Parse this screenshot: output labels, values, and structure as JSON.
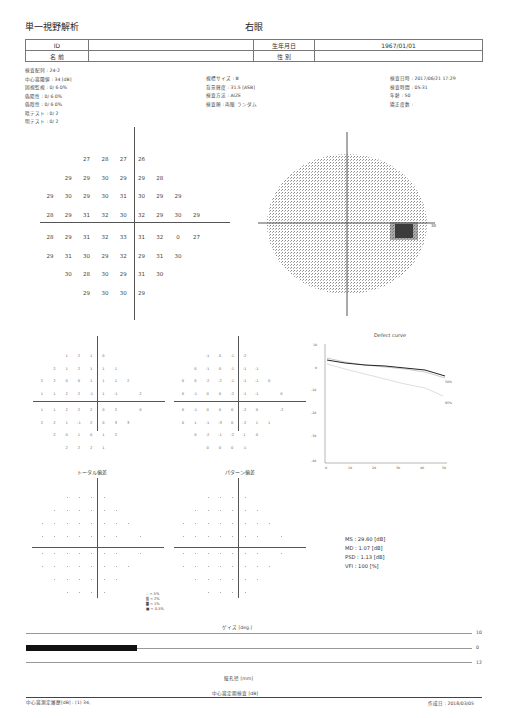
{
  "header": {
    "report_title": "単一視野解析",
    "eye": "右眼",
    "id_label": "ID",
    "id_value": "",
    "name_label": "名 前",
    "name_value": "",
    "dob_label": "生年月日",
    "dob_value": "1967/01/01",
    "sex_label": "性 別",
    "sex_value": ""
  },
  "info_left": [
    "検査配列 : 24-2",
    "中心窩閾値 : 34 [dB]",
    "固視監視 : 0/ 6  0%",
    "偽陽性 : 0/ 6  0%",
    "偽陰性 : 0/ 6  0%",
    "暗テスト : 0/ 2",
    "明テスト : 0/ 2"
  ],
  "info_mid": [
    "視標サイズ : Ⅲ",
    "背景輝度 : 31.5 [ASB]",
    "検査方法 : AIZE",
    "検査順 : 両眼 ランダム"
  ],
  "info_right": [
    "検査日時 : 2017/06/21 17:29",
    "検査時間 : 05:31",
    "年齢 : 50",
    "矯正度数 :"
  ],
  "threshold_grid": {
    "rows": [
      [
        "",
        "",
        "27",
        "28",
        "27",
        "26",
        "",
        "",
        ""
      ],
      [
        "",
        "29",
        "29",
        "30",
        "29",
        "29",
        "28",
        "",
        ""
      ],
      [
        "29",
        "30",
        "29",
        "30",
        "31",
        "30",
        "29",
        "29",
        ""
      ],
      [
        "28",
        "29",
        "31",
        "32",
        "30",
        "32",
        "29",
        "30",
        "29"
      ],
      [
        "28",
        "29",
        "31",
        "32",
        "33",
        "31",
        "32",
        "0",
        "27"
      ],
      [
        "29",
        "31",
        "30",
        "29",
        "32",
        "29",
        "31",
        "30",
        ""
      ],
      [
        "",
        "30",
        "28",
        "30",
        "29",
        "31",
        "30",
        "",
        ""
      ],
      [
        "",
        "",
        "29",
        "30",
        "30",
        "29",
        "",
        "",
        ""
      ]
    ],
    "blind_spot_marker": "○"
  },
  "total_deviation_values": {
    "rows": [
      [
        "",
        "",
        "1",
        "2",
        "1",
        "0",
        "",
        "",
        ""
      ],
      [
        "",
        "2",
        "1",
        "2",
        "1",
        "1",
        "1",
        "",
        ""
      ],
      [
        "2",
        "2",
        "0",
        "0",
        "1",
        "1",
        "1",
        "2",
        ""
      ],
      [
        "1",
        "1",
        "2",
        "2",
        "-1",
        "1",
        "-1",
        "",
        "2"
      ],
      [
        "1",
        "1",
        "2",
        "2",
        "2",
        "0",
        "2",
        "",
        "0"
      ],
      [
        "2",
        "2",
        "1",
        "-1",
        "2",
        "0",
        "3",
        "3",
        ""
      ],
      [
        "",
        "2",
        "0",
        "1",
        "0",
        "1",
        "2",
        "",
        ""
      ],
      [
        "",
        "",
        "2",
        "2",
        "2",
        "1",
        "",
        "",
        ""
      ]
    ]
  },
  "pattern_deviation_values": {
    "rows": [
      [
        "",
        "",
        "-1",
        "0",
        "-1",
        "-2",
        "",
        "",
        ""
      ],
      [
        "",
        "0",
        "-1",
        "0",
        "-1",
        "-1",
        "-1",
        "",
        ""
      ],
      [
        "0",
        "0",
        "-2",
        "-2",
        "-1",
        "-1",
        "-1",
        "0",
        ""
      ],
      [
        "0",
        "-1",
        "0",
        "0",
        "-2",
        "-1",
        "-1",
        "",
        "0"
      ],
      [
        "0",
        "-1",
        "0",
        "0",
        "0",
        "-2",
        "0",
        "",
        "-2"
      ],
      [
        "0",
        "1",
        "-1",
        "-3",
        "0",
        "-2",
        "1",
        "1",
        ""
      ],
      [
        "",
        "0",
        "-2",
        "-1",
        "-2",
        "1",
        "0",
        "",
        ""
      ],
      [
        "",
        "",
        "0",
        "0",
        "0",
        "-1",
        "",
        "",
        ""
      ]
    ]
  },
  "labels": {
    "total_deviation": "トータル偏差",
    "pattern_deviation": "パターン偏差",
    "gaze_label": "ゲイズ [deg.]",
    "pupil_label": "瞳孔径 [mm]",
    "fluct_label": "中心窩定期検査 [dB]",
    "gaze_top": "10",
    "gaze_mid": "0",
    "gaze_bottom": "12",
    "grayscale_edge": "30"
  },
  "legend": [
    {
      "symbol": "∴",
      "text": "< 5%"
    },
    {
      "symbol": "▒",
      "text": "< 2%"
    },
    {
      "symbol": "▓",
      "text": "< 1%"
    },
    {
      "symbol": "■",
      "text": "< 0.5%"
    }
  ],
  "stats": {
    "ms": "MS : 29.60 [dB]",
    "md": "MD : 1.07 [dB]",
    "psd": "PSD : 1.13 [dB]",
    "vfi": "VFI : 100 [%]"
  },
  "footer": {
    "central_threshold": "中心窩測定履歴[dB] :  (1) 34,",
    "created": "作成日 : 2018/03/05"
  },
  "chart_data": {
    "type": "line",
    "title": "Defect curve",
    "xlabel": "",
    "ylabel": "",
    "x_ticks": [
      "0",
      "10",
      "20",
      "30",
      "40",
      "50"
    ],
    "y_ticks": [
      "10",
      "0",
      "-10",
      "-20",
      "-30",
      "-40"
    ],
    "ylim": [
      -40,
      10
    ],
    "xlim": [
      0,
      52
    ],
    "series": [
      {
        "name": "patient",
        "x": [
          0,
          10,
          20,
          30,
          40,
          50
        ],
        "values": [
          3,
          2,
          1.5,
          1,
          0,
          -1.5
        ]
      },
      {
        "name": "5%",
        "x": [
          0,
          10,
          20,
          30,
          40,
          50
        ],
        "values": [
          1,
          -0.5,
          -2,
          -3.5,
          -5,
          -7.5
        ]
      },
      {
        "name": "95%",
        "x": [
          0,
          10,
          20,
          30,
          40,
          50
        ],
        "values": [
          3.5,
          2.5,
          2,
          1.5,
          1,
          0
        ]
      }
    ],
    "annotations": [
      "95%",
      "50%",
      "5%"
    ]
  }
}
